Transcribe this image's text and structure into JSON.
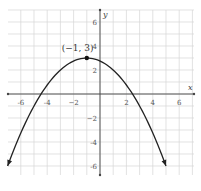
{
  "chart_data": {
    "type": "line",
    "title": "",
    "xlabel": "x",
    "ylabel": "y",
    "xlim": [
      -7,
      7
    ],
    "ylim": [
      -7,
      7
    ],
    "grid": true,
    "x_ticks": [
      -6,
      -4,
      -2,
      2,
      4,
      6
    ],
    "y_ticks": [
      6,
      4,
      2,
      -2,
      -4,
      -6
    ],
    "x_tick_labels": [
      "-6",
      "-4",
      "−2",
      "2",
      "4",
      "6"
    ],
    "y_tick_labels": [
      "6",
      "4",
      "2",
      "−2",
      "-4",
      "-6"
    ],
    "series": [
      {
        "name": "parabola",
        "equation": "y = -0.25(x + 1)^2 + 3",
        "vertex": [
          -1,
          3
        ],
        "x_range": [
          -7,
          5
        ],
        "arrows_both_ends": true
      }
    ],
    "annotations": [
      {
        "text": "(−1, 3)",
        "point": [
          -1,
          3
        ]
      }
    ]
  }
}
